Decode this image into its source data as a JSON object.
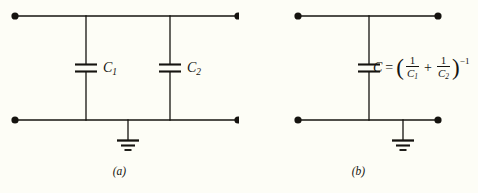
{
  "figure": {
    "background_color": "#fdfdf6",
    "ink_color": "#15130f",
    "panels": [
      {
        "id": "a",
        "caption": "(a)",
        "description": "Two capacitors in parallel branches between a top rail and a grounded bottom rail",
        "components": [
          {
            "type": "capacitor",
            "label": "C",
            "subscript": "1",
            "label_full": "C1"
          },
          {
            "type": "capacitor",
            "label": "C",
            "subscript": "2",
            "label_full": "C2"
          },
          {
            "type": "ground"
          }
        ],
        "terminals": 4
      },
      {
        "id": "b",
        "caption": "(b)",
        "description": "Equivalent single capacitor between a top rail and a grounded bottom rail",
        "components": [
          {
            "type": "capacitor",
            "label": "C",
            "subscript": "",
            "label_full": "C"
          },
          {
            "type": "ground"
          }
        ],
        "terminals": 4,
        "formula": {
          "lhs": "C",
          "equals": "=",
          "open_paren": "(",
          "term1_numerator": "1",
          "term1_denominator": "C",
          "term1_denominator_sub": "1",
          "plus": "+",
          "term2_numerator": "1",
          "term2_denominator": "C",
          "term2_denominator_sub": "2",
          "close_paren": ")",
          "exponent": "−1",
          "plain_text": "C = (1/C1 + 1/C2)^-1"
        }
      }
    ]
  }
}
